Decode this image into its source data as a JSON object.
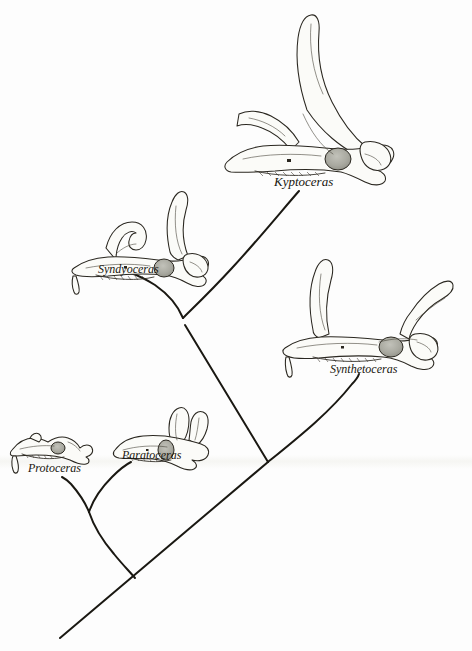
{
  "figure": {
    "kind": "cladogram",
    "background_color": "#fdfdfd",
    "ink_color": "#1a1812",
    "orbit_color": "#a9a9a0"
  },
  "taxa": [
    {
      "id": "kyptoceras",
      "label": "Kyptoceras",
      "label_x": 274,
      "label_y": 174,
      "skull": "kyptoceras-skull",
      "tip_x": 300,
      "tip_y": 190
    },
    {
      "id": "syndyoceras",
      "label": "Syndyoceras",
      "label_x": 98,
      "label_y": 262,
      "skull": "syndyoceras-skull",
      "tip_x": 127,
      "tip_y": 272
    },
    {
      "id": "synthetoceras",
      "label": "Synthetoceras",
      "label_x": 330,
      "label_y": 362,
      "skull": "synthetoceras-skull",
      "tip_x": 358,
      "tip_y": 375
    },
    {
      "id": "paratoceras",
      "label": "Paratoceras",
      "label_x": 122,
      "label_y": 452,
      "skull": "paratoceras-skull",
      "tip_x": 130,
      "tip_y": 462
    },
    {
      "id": "protoceras",
      "label": "Protoceras",
      "label_x": 28,
      "label_y": 465,
      "skull": "protoceras-skull",
      "tip_x": 62,
      "tip_y": 476
    }
  ],
  "nodes": [
    {
      "id": "node-protoceras-paratoceras",
      "x": 89,
      "y": 512
    },
    {
      "id": "node-syndyoceras-kyptoceras",
      "x": 183,
      "y": 318
    },
    {
      "id": "node-crown",
      "x": 268,
      "y": 462
    },
    {
      "id": "root",
      "x": 60,
      "y": 638
    }
  ],
  "branches": [
    {
      "id": "branch-protoceras",
      "from": "protoceras",
      "to": "node-protoceras-paratoceras"
    },
    {
      "id": "branch-paratoceras",
      "from": "paratoceras",
      "to": "node-protoceras-paratoceras"
    },
    {
      "id": "branch-syndyoceras",
      "from": "syndyoceras",
      "to": "node-syndyoceras-kyptoceras"
    },
    {
      "id": "branch-kyptoceras",
      "from": "kyptoceras",
      "to": "node-syndyoceras-kyptoceras"
    },
    {
      "id": "branch-clade-upper",
      "from": "node-syndyoceras-kyptoceras",
      "to": "node-crown"
    },
    {
      "id": "branch-synthetoceras",
      "from": "synthetoceras",
      "to": "node-crown"
    },
    {
      "id": "branch-trunk",
      "from": "node-crown",
      "to": "root"
    },
    {
      "id": "branch-basal-stem",
      "from": "node-protoceras-paratoceras",
      "to": "trunk"
    }
  ]
}
